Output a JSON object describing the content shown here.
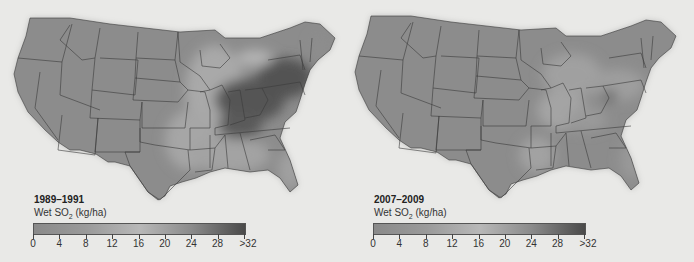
{
  "panels": [
    {
      "id": "left",
      "period": "1989–1991",
      "variable_prefix": "Wet SO",
      "variable_subscript": "2",
      "variable_unit": " (kg/ha)",
      "description": "High wet SO2 deposition concentrated over Ohio River Valley and Northeast"
    },
    {
      "id": "right",
      "period": "2007–2009",
      "variable_prefix": "Wet SO",
      "variable_subscript": "2",
      "variable_unit": " (kg/ha)",
      "description": "Much lower deposition across the eastern US"
    }
  ],
  "legend": {
    "tick_labels": [
      "0",
      "4",
      "8",
      "12",
      "16",
      "20",
      "24",
      "28",
      ">32"
    ],
    "min": 0,
    "max": 32,
    "colors": {
      "low": "#8a8a8a",
      "mid": "#b8b8b8",
      "high": "#4a4a4a"
    }
  },
  "map_colors": {
    "background": "#e9e9e7",
    "land_base": "#8c8c8c",
    "state_border": "#3a3a3a",
    "high_deposition": "#4e4e4e",
    "mid_deposition": "#aaaaaa"
  }
}
